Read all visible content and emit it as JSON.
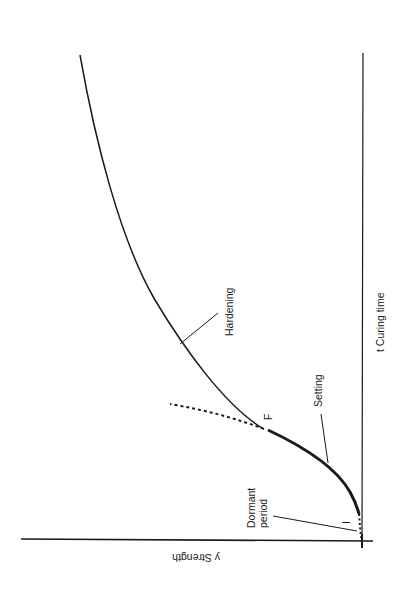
{
  "diagram": {
    "orientation": "rotated 90 degrees clockwise",
    "axes": {
      "y_axis_label": "y Strength",
      "x_axis_label": "t Curing time"
    },
    "labels": {
      "hardening": "Hardening",
      "setting": "Setting",
      "dormant_line1": "Dormant",
      "dormant_line2": "period",
      "point_f": "F",
      "point_i": "I"
    },
    "stages": [
      "Dormant period",
      "Setting",
      "Hardening"
    ],
    "colors": {
      "line": "#1a1a1a",
      "background": "#ffffff"
    }
  }
}
